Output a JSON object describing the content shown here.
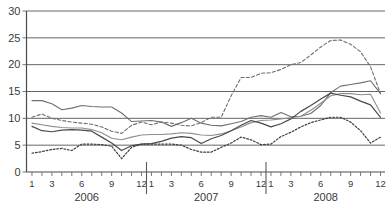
{
  "chart_data": {
    "type": "line",
    "title": "",
    "subtitle": "",
    "xlabel": "",
    "ylabel": "",
    "ylim": [
      0,
      30
    ],
    "yticks": [
      0,
      5,
      10,
      15,
      20,
      25,
      30
    ],
    "grid": true,
    "legend_position": "none",
    "x_group_labels": [
      "2006",
      "2007",
      "2008"
    ],
    "x_tick_labels": [
      "1",
      "",
      "3",
      "",
      "",
      "6",
      "",
      "",
      "9",
      "",
      "",
      "12",
      "1",
      "",
      "3",
      "",
      "",
      "6",
      "",
      "",
      "9",
      "",
      "",
      "12",
      "1",
      "",
      "3",
      "",
      "",
      "6",
      "",
      "",
      "9",
      "",
      "",
      "12"
    ],
    "x": [
      "2006-01",
      "2006-02",
      "2006-03",
      "2006-04",
      "2006-05",
      "2006-06",
      "2006-07",
      "2006-08",
      "2006-09",
      "2006-10",
      "2006-11",
      "2006-12",
      "2007-01",
      "2007-02",
      "2007-03",
      "2007-04",
      "2007-05",
      "2007-06",
      "2007-07",
      "2007-08",
      "2007-09",
      "2007-10",
      "2007-11",
      "2007-12",
      "2008-01",
      "2008-02",
      "2008-03",
      "2008-04",
      "2008-05",
      "2008-06",
      "2008-07",
      "2008-08",
      "2008-09",
      "2008-10",
      "2008-11",
      "2008-12"
    ],
    "series": [
      {
        "name": "series-1",
        "style": "solid",
        "color": "#707070",
        "width": 1.1,
        "values": [
          13.3,
          13.3,
          12.7,
          11.6,
          11.9,
          12.4,
          12.2,
          12.1,
          12.1,
          11.0,
          9.4,
          9.5,
          9.6,
          9.3,
          8.5,
          9.2,
          10.0,
          9.1,
          8.7,
          8.6,
          9.0,
          9.4,
          10.2,
          10.5,
          10.2,
          11.1,
          10.3,
          10.4,
          10.9,
          12.4,
          14.8,
          16.0,
          16.3,
          16.6,
          17.0,
          14.6
        ]
      },
      {
        "name": "series-2",
        "style": "solid",
        "color": "#8f8f8f",
        "width": 1.1,
        "values": [
          9.1,
          8.8,
          8.5,
          8.3,
          8.2,
          8.2,
          7.9,
          7.3,
          6.3,
          6.0,
          6.5,
          6.9,
          7.0,
          7.0,
          7.1,
          7.3,
          7.2,
          6.9,
          6.8,
          7.1,
          7.7,
          8.4,
          9.2,
          9.6,
          9.7,
          9.9,
          10.1,
          10.4,
          11.5,
          12.8,
          14.2,
          14.6,
          14.6,
          14.4,
          14.5,
          11.0
        ]
      },
      {
        "name": "series-3",
        "style": "solid",
        "color": "#4a4a4a",
        "width": 1.2,
        "values": [
          8.5,
          7.7,
          7.5,
          7.8,
          7.9,
          7.8,
          7.6,
          6.5,
          5.4,
          4.0,
          4.9,
          5.2,
          5.3,
          5.7,
          6.3,
          6.6,
          6.4,
          5.3,
          6.2,
          6.8,
          7.7,
          8.7,
          9.6,
          9.1,
          8.4,
          9.0,
          9.9,
          11.3,
          12.4,
          13.6,
          14.7,
          14.3,
          14.0,
          13.2,
          12.5,
          10.2
        ]
      },
      {
        "name": "series-4",
        "style": "dashed",
        "color": "#6e6e6e",
        "width": 1.1,
        "values": [
          10.2,
          10.8,
          10.0,
          9.6,
          9.3,
          9.1,
          8.9,
          8.4,
          7.6,
          7.2,
          8.7,
          9.3,
          8.8,
          9.3,
          9.1,
          8.7,
          8.6,
          9.2,
          10.2,
          10.2,
          14.2,
          17.6,
          17.6,
          18.4,
          18.5,
          19.1,
          20.0,
          20.4,
          21.8,
          23.3,
          24.5,
          24.6,
          23.8,
          22.4,
          19.6,
          14.6
        ]
      },
      {
        "name": "series-5",
        "style": "dotted",
        "color": "#3d3d3d",
        "width": 1.2,
        "values": [
          3.5,
          3.8,
          4.2,
          4.4,
          4.0,
          5.2,
          5.2,
          5.1,
          4.8,
          2.5,
          4.6,
          5.2,
          5.2,
          5.2,
          5.2,
          5.0,
          4.2,
          3.7,
          3.7,
          4.6,
          5.4,
          6.5,
          6.0,
          5.1,
          5.2,
          6.6,
          7.4,
          8.4,
          9.2,
          9.7,
          10.2,
          10.2,
          9.3,
          7.7,
          5.4,
          6.5
        ]
      }
    ]
  },
  "axes": {
    "y_axis_name": "value-axis",
    "x_axis_name": "time-axis"
  }
}
